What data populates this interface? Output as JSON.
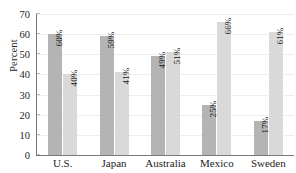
{
  "chart_data": {
    "type": "bar",
    "title": "",
    "xlabel": "",
    "ylabel": "Percent",
    "ylim": [
      0,
      70
    ],
    "ytick_step": 10,
    "yticks": [
      0,
      10,
      20,
      30,
      40,
      50,
      60,
      70
    ],
    "ytick_labels": [
      "0",
      "10",
      "20",
      "30",
      "40",
      "50",
      "60",
      "70"
    ],
    "grid": true,
    "legend": "none",
    "categories": [
      "U.S.",
      "Japan",
      "Australia",
      "Mexico",
      "Sweden"
    ],
    "series": [
      {
        "name": "series-1",
        "color": "#b4b4b4",
        "values": [
          60,
          59,
          49,
          25,
          17
        ],
        "labels": [
          "60%",
          "59%",
          "49%",
          "25%",
          "17%"
        ]
      },
      {
        "name": "series-2",
        "color": "#d9d9d9",
        "values": [
          40,
          41,
          51,
          66,
          61
        ],
        "labels": [
          "40%",
          "41%",
          "51%",
          "66%",
          "61%"
        ]
      }
    ]
  },
  "axis": {
    "line_color": "#7a7a7a",
    "grid_color": "#eeeeee"
  }
}
